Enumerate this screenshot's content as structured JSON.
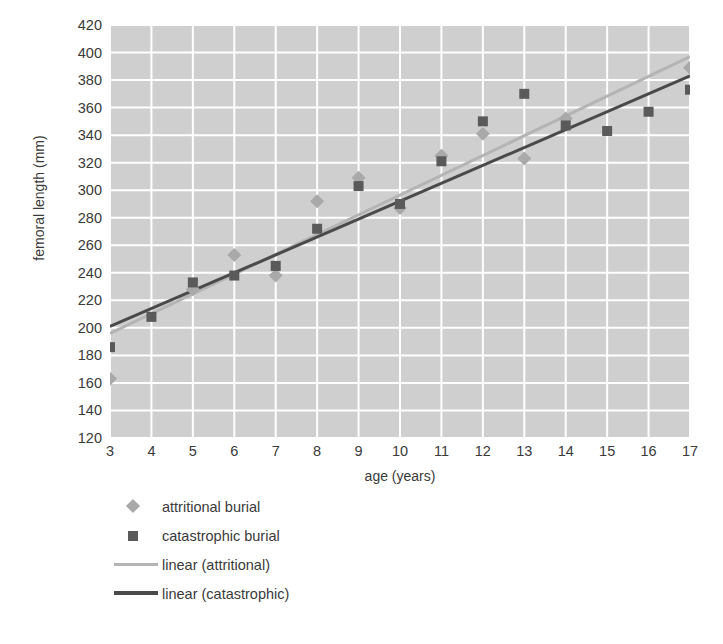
{
  "chart_data": {
    "type": "scatter",
    "title": "",
    "xlabel": "age (years)",
    "ylabel": "femoral length (mm)",
    "xlim": [
      3,
      17
    ],
    "ylim": [
      120,
      420
    ],
    "ytick_step": 20,
    "xtick_step": 1,
    "grid": true,
    "legend_position": "bottom-left",
    "xticks": [
      3,
      4,
      5,
      6,
      7,
      8,
      9,
      10,
      11,
      12,
      13,
      14,
      15,
      16,
      17
    ],
    "yticks": [
      420,
      400,
      380,
      360,
      340,
      320,
      300,
      280,
      260,
      240,
      220,
      200,
      180,
      160,
      140,
      120
    ],
    "series": [
      {
        "name": "attritional burial",
        "marker": "diamond",
        "color": "#a9a9a9",
        "x": [
          3,
          5,
          6,
          7,
          8,
          9,
          10,
          11,
          12,
          13,
          14,
          17
        ],
        "y": [
          163,
          228,
          253,
          238,
          292,
          309,
          287,
          325,
          341,
          323,
          352,
          389
        ]
      },
      {
        "name": "catastrophic burial",
        "marker": "square",
        "color": "#5a5a5a",
        "x": [
          3,
          4,
          5,
          6,
          7,
          8,
          9,
          10,
          11,
          12,
          13,
          14,
          15,
          16,
          17
        ],
        "y": [
          186,
          208,
          233,
          238,
          245,
          272,
          303,
          290,
          321,
          350,
          370,
          347,
          343,
          357,
          373
        ]
      }
    ],
    "trendlines": [
      {
        "name": "linear (attritional)",
        "color": "#b4b4b4",
        "x": [
          3,
          17
        ],
        "y": [
          196,
          397
        ]
      },
      {
        "name": "linear (catastrophic)",
        "color": "#4a4a4a",
        "x": [
          3,
          17
        ],
        "y": [
          201,
          383
        ]
      }
    ],
    "legend_entries": [
      {
        "label": "attritional burial",
        "key": "diamond-marker",
        "color": "#a9a9a9"
      },
      {
        "label": "catastrophic burial",
        "key": "square-marker",
        "color": "#5a5a5a"
      },
      {
        "label": "linear (attritional)",
        "key": "light-line",
        "color": "#b4b4b4"
      },
      {
        "label": "linear (catastrophic)",
        "key": "dark-line",
        "color": "#4a4a4a"
      }
    ],
    "style": {
      "plot_background": "#cfcfcf",
      "gridline_color": "#ffffff",
      "text_color": "#3a3a3a",
      "page_background": "#ffffff"
    }
  }
}
